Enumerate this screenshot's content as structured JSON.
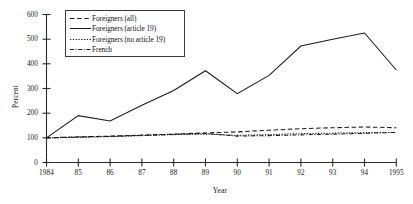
{
  "chart_data": {
    "type": "line",
    "title": "",
    "xlabel": "Year",
    "ylabel": "Percent",
    "ylim": [
      0,
      600
    ],
    "yticks": [
      0,
      100,
      200,
      300,
      400,
      500,
      600
    ],
    "grid": false,
    "legend_position": "top-left",
    "categories": [
      "1984",
      "85",
      "86",
      "87",
      "88",
      "89",
      "90",
      "91",
      "92",
      "93",
      "94",
      "1995"
    ],
    "x": [
      1984,
      1985,
      1986,
      1987,
      1988,
      1989,
      1990,
      1991,
      1992,
      1993,
      1994,
      1995
    ],
    "series": [
      {
        "name": "Foreigners (all)",
        "style": "dashed",
        "color": "#1a1a1a",
        "values": [
          100,
          104,
          107,
          111,
          115,
          120,
          124,
          131,
          137,
          141,
          144,
          141
        ]
      },
      {
        "name": "Foreigners (article 19)",
        "style": "solid",
        "color": "#1a1a1a",
        "values": [
          100,
          190,
          168,
          232,
          292,
          372,
          279,
          353,
          472,
          500,
          525,
          375
        ]
      },
      {
        "name": "Foreigners (no article 19)",
        "style": "dotted",
        "color": "#1a1a1a",
        "values": [
          100,
          102,
          105,
          109,
          113,
          115,
          110,
          113,
          117,
          119,
          121,
          122
        ]
      },
      {
        "name": "French",
        "style": "dashdot",
        "color": "#1a1a1a",
        "values": [
          100,
          103,
          106,
          110,
          114,
          118,
          107,
          109,
          112,
          115,
          118,
          122
        ]
      }
    ]
  },
  "axis": {
    "y_title": "Percent",
    "x_title": "Year",
    "y_tick_labels": [
      "600",
      "500",
      "400",
      "300",
      "200",
      "100",
      "0"
    ],
    "x_tick_labels": [
      "1984",
      "85",
      "86",
      "87",
      "88",
      "89",
      "90",
      "91",
      "92",
      "93",
      "94",
      "1995"
    ]
  },
  "legend": {
    "items": [
      {
        "label": "Foreigners (all)",
        "style": "dashed"
      },
      {
        "label": "Foreigners (article 19)",
        "style": "solid"
      },
      {
        "label": "Foreigners (no article 19)",
        "style": "dotted"
      },
      {
        "label": "French",
        "style": "dashdot"
      }
    ]
  }
}
